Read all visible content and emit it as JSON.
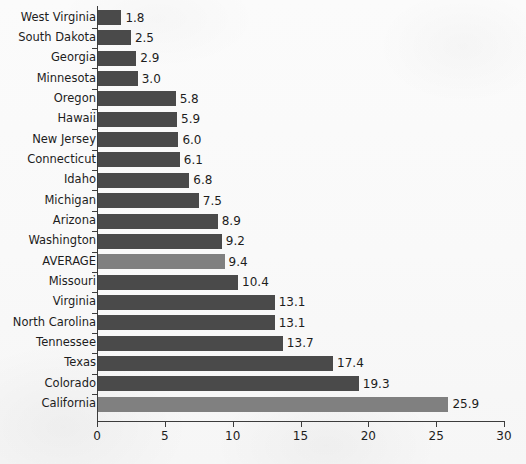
{
  "chart_data": {
    "type": "bar",
    "orientation": "horizontal",
    "title": "",
    "subtitle": "",
    "xlabel": "",
    "ylabel": "",
    "xlim": [
      0,
      30
    ],
    "xticks": [
      0,
      5,
      10,
      15,
      20,
      25,
      30
    ],
    "xticklabels": [
      "0",
      "5",
      "10",
      "15",
      "20",
      "25",
      "30"
    ],
    "grid": false,
    "legend": null,
    "value_label_format": "one-decimal",
    "sorted": "ascending",
    "categories": [
      "West Virginia",
      "South Dakota",
      "Georgia",
      "Minnesota",
      "Oregon",
      "Hawaii",
      "New Jersey",
      "Connecticut",
      "Idaho",
      "Michigan",
      "Arizona",
      "Washington",
      "AVERAGE",
      "Missouri",
      "Virginia",
      "North Carolina",
      "Tennessee",
      "Texas",
      "Colorado",
      "California"
    ],
    "values": [
      1.8,
      2.5,
      2.9,
      3.0,
      5.8,
      5.9,
      6.0,
      6.1,
      6.8,
      7.5,
      8.9,
      9.2,
      9.4,
      10.4,
      13.1,
      13.1,
      13.7,
      17.4,
      19.3,
      25.9
    ],
    "value_labels": [
      "1.8",
      "2.5",
      "2.9",
      "3.0",
      "5.8",
      "5.9",
      "6.0",
      "6.1",
      "6.8",
      "7.5",
      "8.9",
      "9.2",
      "9.4",
      "10.4",
      "13.1",
      "13.1",
      "13.7",
      "17.4",
      "19.3",
      "25.9"
    ],
    "highlighted_categories": [
      "AVERAGE",
      "California"
    ]
  },
  "colors": {
    "bar": "#4a4a4a",
    "bar_highlight": "#808080",
    "axis": "#3c3c3c",
    "text": "#1d1d1d",
    "background": "#fbfbfb"
  }
}
